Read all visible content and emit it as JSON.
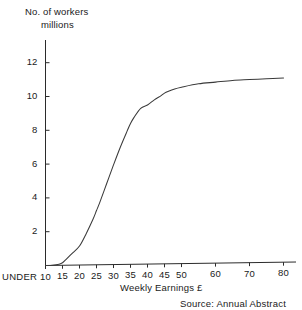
{
  "chart_data": {
    "type": "line",
    "title": "",
    "ylabel": "No. of workers millions",
    "ylabel_line1": "No. of workers",
    "ylabel_line2": "millions",
    "xlabel": "Weekly Earnings £",
    "source": "Source:  Annual Abstract",
    "under_label": "UNDER",
    "ylim": [
      0,
      13.3
    ],
    "yticks": [
      2,
      4,
      6,
      8,
      10,
      12
    ],
    "ytick_labels": [
      "2",
      "4",
      "6",
      "8",
      "10",
      "12"
    ],
    "xtick_labels": [
      "10",
      "15",
      "20",
      "25",
      "30",
      "35",
      "40",
      "45",
      "50",
      "60",
      "70",
      "80"
    ],
    "xticks": [
      10,
      15,
      20,
      25,
      30,
      35,
      40,
      45,
      50,
      60,
      70,
      80
    ],
    "grid": false,
    "legend": false,
    "series": [
      {
        "name": "Cumulative number of workers",
        "x": [
          10,
          12,
          14,
          15,
          16,
          18,
          20,
          22,
          24,
          25,
          26,
          28,
          30,
          32,
          34,
          35,
          36,
          38,
          40,
          42,
          44,
          45,
          46,
          48,
          50,
          55,
          60,
          65,
          70,
          75,
          80
        ],
        "values": [
          0.0,
          0.02,
          0.08,
          0.16,
          0.35,
          0.75,
          1.15,
          1.9,
          2.75,
          3.25,
          3.75,
          4.85,
          5.95,
          7.0,
          7.95,
          8.4,
          8.75,
          9.3,
          9.5,
          9.8,
          10.05,
          10.2,
          10.3,
          10.45,
          10.55,
          10.75,
          10.85,
          10.95,
          11.0,
          11.05,
          11.1
        ]
      }
    ]
  },
  "axes": {
    "y_axis_name": "vertical-axis",
    "x_axis_name": "horizontal-axis"
  }
}
